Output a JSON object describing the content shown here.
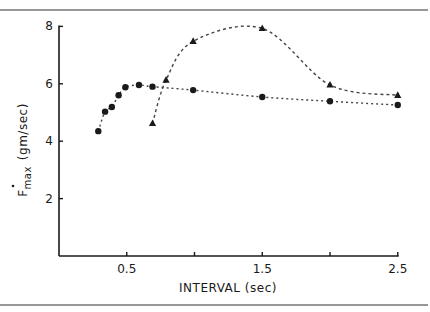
{
  "chart_data": {
    "type": "scatter",
    "title": "",
    "xlabel": "INTERVAL (sec)",
    "ylabel_main": "F",
    "ylabel_sub": "max",
    "ylabel_units": "(gm/sec)",
    "ylabel": "Ḟmax (gm/sec)",
    "xlim": [
      0,
      2.5
    ],
    "ylim": [
      0,
      8
    ],
    "xticks": [
      0.5,
      1.0,
      1.5,
      2.0,
      2.5
    ],
    "xtick_labels": [
      "0.5",
      "",
      "1.5",
      "",
      "2.5"
    ],
    "yticks": [
      2,
      4,
      6,
      8
    ],
    "ytick_labels": [
      "2",
      "4",
      "6",
      "8"
    ],
    "grid": false,
    "legend": null,
    "series": [
      {
        "name": "circles",
        "marker": "circle",
        "line": "dotted",
        "points": [
          [
            0.29,
            4.35
          ],
          [
            0.34,
            5.03
          ],
          [
            0.39,
            5.19
          ],
          [
            0.44,
            5.6
          ],
          [
            0.49,
            5.88
          ],
          [
            0.59,
            5.96
          ],
          [
            0.69,
            5.9
          ],
          [
            0.99,
            5.78
          ],
          [
            1.5,
            5.54
          ],
          [
            2.0,
            5.39
          ],
          [
            2.5,
            5.26
          ]
        ]
      },
      {
        "name": "triangles",
        "marker": "triangle",
        "line": "dashed",
        "points": [
          [
            0.69,
            4.62
          ],
          [
            0.79,
            6.13
          ],
          [
            0.99,
            7.48
          ],
          [
            1.5,
            7.93
          ],
          [
            2.0,
            5.96
          ],
          [
            2.5,
            5.6
          ]
        ]
      }
    ]
  },
  "colors": {
    "ink": "#1a1a1a",
    "background": "#ffffff"
  }
}
